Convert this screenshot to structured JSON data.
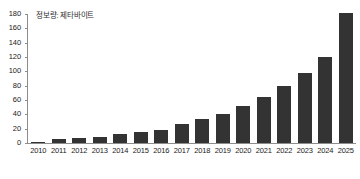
{
  "chart_data": {
    "type": "bar",
    "title": "정보량: 제타바이트",
    "xlabel": "",
    "ylabel": "",
    "categories": [
      "2010",
      "2011",
      "2012",
      "2013",
      "2014",
      "2015",
      "2016",
      "2017",
      "2018",
      "2019",
      "2020",
      "2021",
      "2022",
      "2023",
      "2024",
      "2025"
    ],
    "values": [
      2,
      5,
      6.5,
      9,
      12.5,
      15.5,
      18,
      26,
      33,
      41,
      51,
      64,
      79,
      97,
      120,
      181
    ],
    "ylim": [
      0,
      180
    ],
    "yticks": [
      0,
      20,
      40,
      60,
      80,
      100,
      120,
      140,
      160,
      180
    ],
    "ytick_labels": [
      "0",
      "20",
      "40",
      "60",
      "80",
      "100",
      "120",
      "140",
      "160",
      "180"
    ],
    "grid": false,
    "legend": "none",
    "bar_color": "#333333",
    "axis_color": "#8d8d8d",
    "text_color": "#1a1a1a",
    "background": "#ffffff"
  }
}
